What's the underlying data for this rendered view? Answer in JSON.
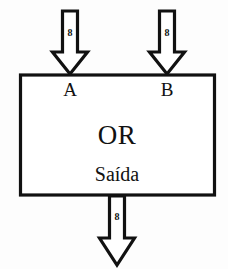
{
  "diagram": {
    "title": "OR",
    "gate": {
      "operation_label": "OR",
      "output_label": "Saída",
      "inputs": [
        {
          "name": "A",
          "bus_width": "8"
        },
        {
          "name": "B",
          "bus_width": "8"
        }
      ],
      "output": {
        "bus_width": "8"
      }
    },
    "colors": {
      "stroke": "#111111",
      "fill": "#ffffff",
      "background": "#fdfdfd"
    }
  }
}
